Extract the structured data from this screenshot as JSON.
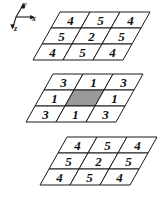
{
  "diagram": {
    "axes": {
      "x_label": "x",
      "y_label": "y",
      "z_label": "z"
    },
    "colors": {
      "stroke": "#1a1a1a",
      "cell_fill": "#ffffff",
      "highlight_fill": "#9a9a9a",
      "background": "#ffffff",
      "text": "#111111"
    },
    "slices": [
      {
        "name": "top-slice",
        "rows": [
          [
            "4",
            "5",
            "4"
          ],
          [
            "5",
            "2",
            "5"
          ],
          [
            "4",
            "5",
            "4"
          ]
        ],
        "highlight": null
      },
      {
        "name": "middle-slice",
        "rows": [
          [
            "3",
            "1",
            "3"
          ],
          [
            "1",
            "",
            "1"
          ],
          [
            "3",
            "1",
            "3"
          ]
        ],
        "highlight": {
          "row": 1,
          "col": 1
        }
      },
      {
        "name": "bottom-slice",
        "rows": [
          [
            "4",
            "5",
            "4"
          ],
          [
            "5",
            "2",
            "5"
          ],
          [
            "4",
            "5",
            "4"
          ]
        ],
        "highlight": null
      }
    ]
  },
  "chart_data": {
    "type": "heatmap",
    "xlabel": "x",
    "ylabel": "y",
    "zlabel": "z",
    "slices": [
      {
        "name": "top-slice",
        "values": [
          [
            4,
            5,
            4
          ],
          [
            5,
            2,
            5
          ],
          [
            4,
            5,
            4
          ]
        ]
      },
      {
        "name": "middle-slice",
        "values": [
          [
            3,
            1,
            3
          ],
          [
            1,
            null,
            1
          ],
          [
            3,
            1,
            3
          ]
        ]
      },
      {
        "name": "bottom-slice",
        "values": [
          [
            4,
            5,
            4
          ],
          [
            5,
            2,
            5
          ],
          [
            4,
            5,
            4
          ]
        ]
      }
    ]
  }
}
